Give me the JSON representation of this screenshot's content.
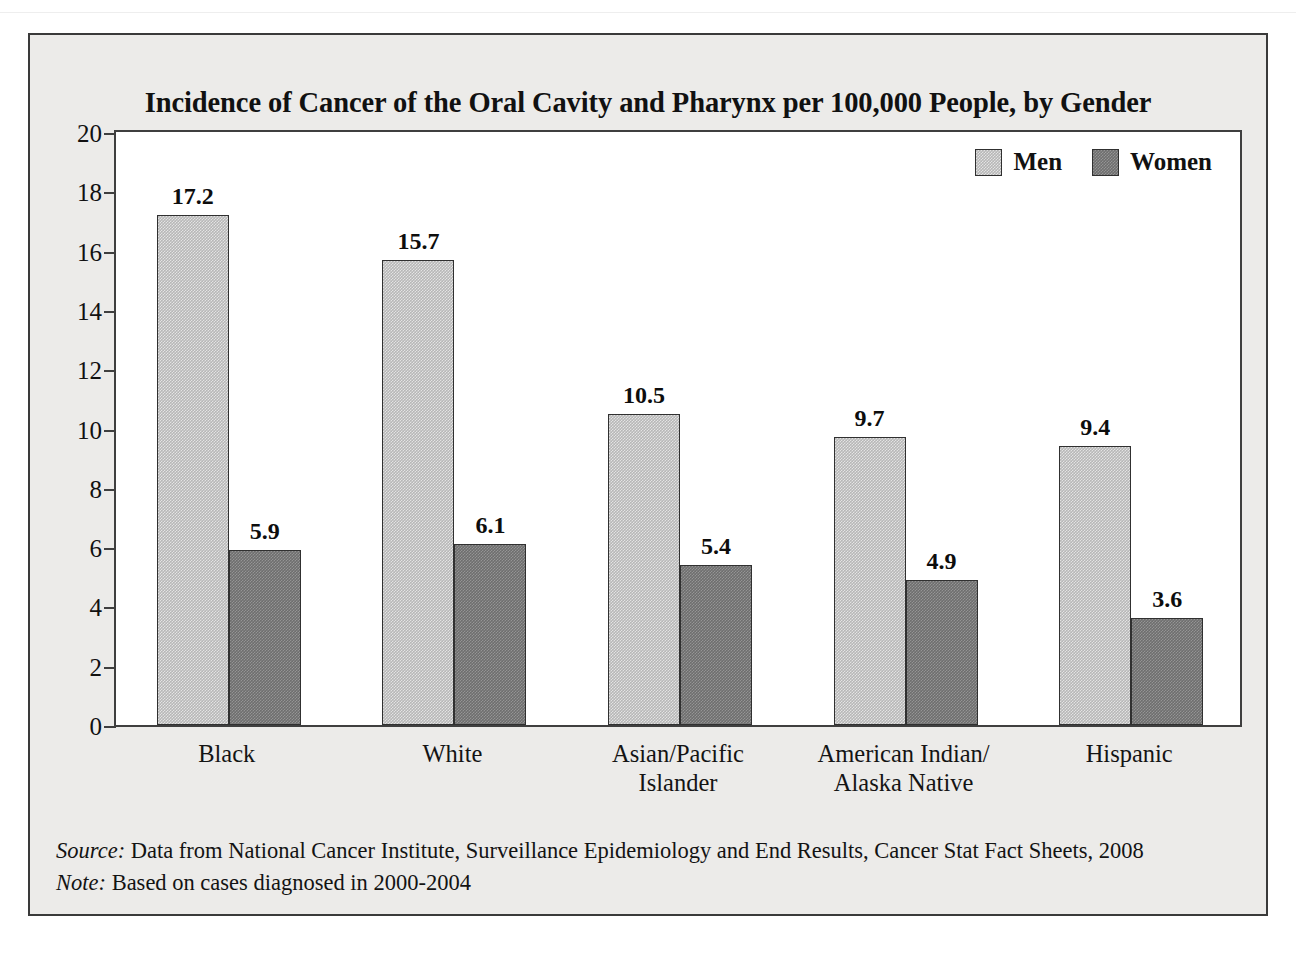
{
  "page_header": {
    "left_text": "",
    "right_text": ""
  },
  "figure": {
    "title": "Incidence of Cancer of the Oral Cavity and Pharynx per 100,000 People, by Gender",
    "footnotes": [
      {
        "label": "Source:",
        "text": " Data from National Cancer Institute, Surveillance Epidemiology and End Results, Cancer Stat Fact Sheets, 2008"
      },
      {
        "label": "Note:",
        "text": " Based on cases diagnosed in 2000-2004"
      }
    ],
    "colors": {
      "men": "#b7b7b7",
      "women": "#6e6e6e",
      "frame": "#3a3a3a",
      "panel": "#ecebe9",
      "plot_background": "#ffffff",
      "text": "#111111"
    }
  },
  "chart_data": {
    "type": "bar",
    "title": "Incidence of Cancer of the Oral Cavity and Pharynx per 100,000 People, by Gender",
    "xlabel": "",
    "ylabel": "",
    "ylim": [
      0,
      20
    ],
    "yticks": [
      0,
      2,
      4,
      6,
      8,
      10,
      12,
      14,
      16,
      18,
      20
    ],
    "grid": false,
    "legend_position": "top-right",
    "categories": [
      "Black",
      "White",
      "Asian/Pacific\nIslander",
      "American Indian/\nAlaska Native",
      "Hispanic"
    ],
    "category_lines": [
      [
        "Black"
      ],
      [
        "White"
      ],
      [
        "Asian/Pacific",
        "Islander"
      ],
      [
        "American Indian/",
        "Alaska Native"
      ],
      [
        "Hispanic"
      ]
    ],
    "series": [
      {
        "name": "Men",
        "color": "#b7b7b7",
        "values": [
          17.2,
          15.7,
          10.5,
          9.7,
          9.4
        ]
      },
      {
        "name": "Women",
        "color": "#6e6e6e",
        "values": [
          5.9,
          6.1,
          5.4,
          4.9,
          3.6
        ]
      }
    ],
    "value_labels": {
      "men": [
        "17.2",
        "15.7",
        "10.5",
        "9.7",
        "9.4"
      ],
      "women": [
        "5.9",
        "6.1",
        "5.4",
        "4.9",
        "3.6"
      ]
    }
  }
}
